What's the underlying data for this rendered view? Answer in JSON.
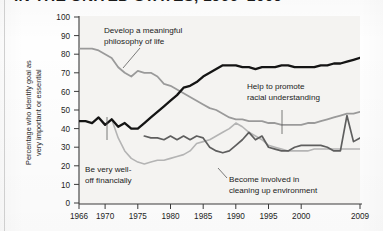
{
  "title": "IN THE UNITED STATES, 1966–2009",
  "axes": {
    "ylabel": "Percentage who identify goal as\nvery important or essential",
    "yticks": [
      "100",
      "90",
      "80",
      "70",
      "60",
      "50",
      "40",
      "30",
      "20",
      "10",
      "0"
    ],
    "xticks": [
      "1966",
      "1970",
      "1975",
      "1980",
      "1985",
      "1990",
      "1995",
      "2000",
      "2009"
    ]
  },
  "annotations": {
    "philosophy": "Develop a meaningful\nphilosophy of life",
    "philosophy_l1": "Develop a meaningful",
    "philosophy_l2": "philosophy of life",
    "financial_l1": "Be very well-",
    "financial_l2": "off financially",
    "racial_l1": "Help to promote",
    "racial_l2": "racial understanding",
    "environment_l1": "Become involved in",
    "environment_l2": "cleaning up environment"
  },
  "colors": {
    "financial": "#141414",
    "philosophy": "#9a9a9a",
    "racial": "#5e5e5e",
    "environment": "#b4b4b4",
    "axis": "#3a3a3a",
    "text": "#1b1b1b"
  },
  "chart_data": {
    "type": "line",
    "title": "IN THE UNITED STATES, 1966–2009",
    "xlabel": "",
    "ylabel": "Percentage who identify goal as very important or essential",
    "xlim": [
      1966,
      2009
    ],
    "ylim": [
      0,
      100
    ],
    "ytick_step": 10,
    "grid": false,
    "legend": "inline-annotations",
    "series": [
      {
        "name": "Be very well-off financially",
        "color": "#141414",
        "x": [
          1966,
          1967,
          1968,
          1969,
          1970,
          1971,
          1972,
          1973,
          1974,
          1975,
          1976,
          1977,
          1978,
          1979,
          1980,
          1981,
          1982,
          1983,
          1984,
          1985,
          1986,
          1987,
          1988,
          1989,
          1990,
          1991,
          1992,
          1993,
          1994,
          1995,
          1996,
          1997,
          1998,
          1999,
          2000,
          2001,
          2002,
          2003,
          2004,
          2005,
          2006,
          2007,
          2008,
          2009
        ],
        "values": [
          44,
          44,
          43,
          46,
          42,
          45,
          41,
          43,
          40,
          40,
          43,
          46,
          49,
          52,
          55,
          58,
          62,
          63,
          65,
          68,
          70,
          72,
          74,
          74,
          74,
          73,
          73,
          72,
          73,
          73,
          73,
          74,
          74,
          73,
          73,
          73,
          73,
          74,
          74,
          75,
          75,
          76,
          77,
          78
        ]
      },
      {
        "name": "Develop a meaningful philosophy of life",
        "color": "#9a9a9a",
        "x": [
          1966,
          1967,
          1968,
          1969,
          1970,
          1971,
          1972,
          1973,
          1974,
          1975,
          1976,
          1977,
          1978,
          1979,
          1980,
          1981,
          1982,
          1983,
          1984,
          1985,
          1986,
          1987,
          1988,
          1989,
          1990,
          1991,
          1992,
          1993,
          1994,
          1995,
          1996,
          1997,
          1998,
          1999,
          2000,
          2001,
          2002,
          2003,
          2004,
          2005,
          2006,
          2007,
          2008,
          2009
        ],
        "values": [
          83,
          83,
          83,
          82,
          80,
          78,
          73,
          70,
          68,
          71,
          70,
          70,
          68,
          64,
          63,
          61,
          59,
          57,
          55,
          53,
          51,
          50,
          48,
          46,
          45,
          45,
          44,
          44,
          44,
          43,
          43,
          42,
          42,
          42,
          42,
          43,
          43,
          44,
          45,
          46,
          47,
          48,
          48,
          49
        ]
      },
      {
        "name": "Help to promote racial understanding",
        "color": "#5e5e5e",
        "x": [
          1976,
          1977,
          1978,
          1979,
          1980,
          1981,
          1982,
          1983,
          1984,
          1985,
          1986,
          1987,
          1988,
          1989,
          1990,
          1991,
          1992,
          1993,
          1994,
          1995,
          1996,
          1997,
          1998,
          1999,
          2000,
          2001,
          2002,
          2003,
          2004,
          2005,
          2006,
          2007,
          2008,
          2009
        ],
        "values": [
          36,
          35,
          35,
          34,
          36,
          34,
          36,
          34,
          36,
          35,
          30,
          28,
          27,
          28,
          31,
          34,
          38,
          34,
          36,
          30,
          29,
          28,
          28,
          30,
          31,
          31,
          31,
          31,
          30,
          28,
          28,
          47,
          33,
          35
        ]
      },
      {
        "name": "Become involved in cleaning up environment",
        "color": "#b4b4b4",
        "x": [
          1971,
          1972,
          1973,
          1974,
          1975,
          1976,
          1977,
          1978,
          1979,
          1980,
          1981,
          1982,
          1983,
          1984,
          1985,
          1986,
          1987,
          1988,
          1989,
          1990,
          1991,
          1992,
          1993,
          1994,
          1995,
          1996,
          1997,
          1998,
          1999,
          2000,
          2001,
          2002,
          2003,
          2004,
          2005,
          2006,
          2007,
          2008,
          2009
        ],
        "values": [
          45,
          35,
          28,
          24,
          22,
          21,
          22,
          23,
          23,
          24,
          25,
          26,
          28,
          32,
          33,
          34,
          36,
          38,
          40,
          43,
          41,
          38,
          36,
          34,
          31,
          30,
          29,
          28,
          28,
          28,
          28,
          29,
          29,
          29,
          29,
          29,
          29,
          29,
          29
        ]
      }
    ]
  }
}
